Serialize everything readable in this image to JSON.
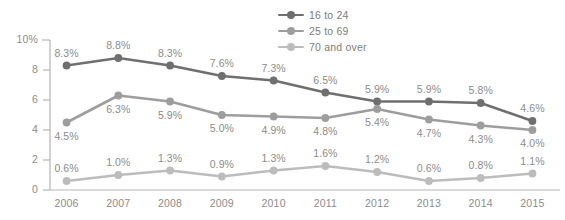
{
  "chart_data": {
    "type": "line",
    "title": "",
    "xlabel": "",
    "ylabel": "",
    "categories": [
      "2006",
      "2007",
      "2008",
      "2009",
      "2010",
      "2011",
      "2012",
      "2013",
      "2014",
      "2015"
    ],
    "ylim": [
      0,
      10
    ],
    "yticks": [
      "0",
      "2",
      "4",
      "6",
      "8",
      "10%"
    ],
    "grid": false,
    "legend_position": "top-right",
    "series": [
      {
        "name": "16 to 24",
        "color": "#6f6f6f",
        "values": [
          8.3,
          8.8,
          8.3,
          7.6,
          7.3,
          6.5,
          5.9,
          5.9,
          5.8,
          4.6
        ],
        "labels": [
          "8.3%",
          "8.8%",
          "8.3%",
          "7.6%",
          "7.3%",
          "6.5%",
          "5.9%",
          "5.9%",
          "5.8%",
          "4.6%"
        ],
        "label_positions": [
          "above",
          "above",
          "above",
          "above",
          "above",
          "above",
          "above",
          "above",
          "above",
          "above"
        ]
      },
      {
        "name": "25 to 69",
        "color": "#9d9d9d",
        "values": [
          4.5,
          6.3,
          5.9,
          5.0,
          4.9,
          4.8,
          5.4,
          4.7,
          4.3,
          4.0
        ],
        "labels": [
          "4.5%",
          "6.3%",
          "5.9%",
          "5.0%",
          "4.9%",
          "4.8%",
          "5.4%",
          "4.7%",
          "4.3%",
          "4.0%"
        ],
        "label_positions": [
          "below",
          "below",
          "below",
          "below",
          "below",
          "below",
          "below",
          "below",
          "below",
          "below"
        ]
      },
      {
        "name": "70 and over",
        "color": "#bcbcbc",
        "values": [
          0.6,
          1.0,
          1.3,
          0.9,
          1.3,
          1.6,
          1.2,
          0.6,
          0.8,
          1.1
        ],
        "labels": [
          "0.6%",
          "1.0%",
          "1.3%",
          "0.9%",
          "1.3%",
          "1.6%",
          "1.2%",
          "0.6%",
          "0.8%",
          "1.1%"
        ],
        "label_positions": [
          "above",
          "above",
          "above",
          "above",
          "above",
          "above",
          "above",
          "above",
          "above",
          "above"
        ]
      }
    ]
  },
  "axis": {
    "line_color": "#b5b5b5",
    "tick_color": "#b5b5b5"
  }
}
